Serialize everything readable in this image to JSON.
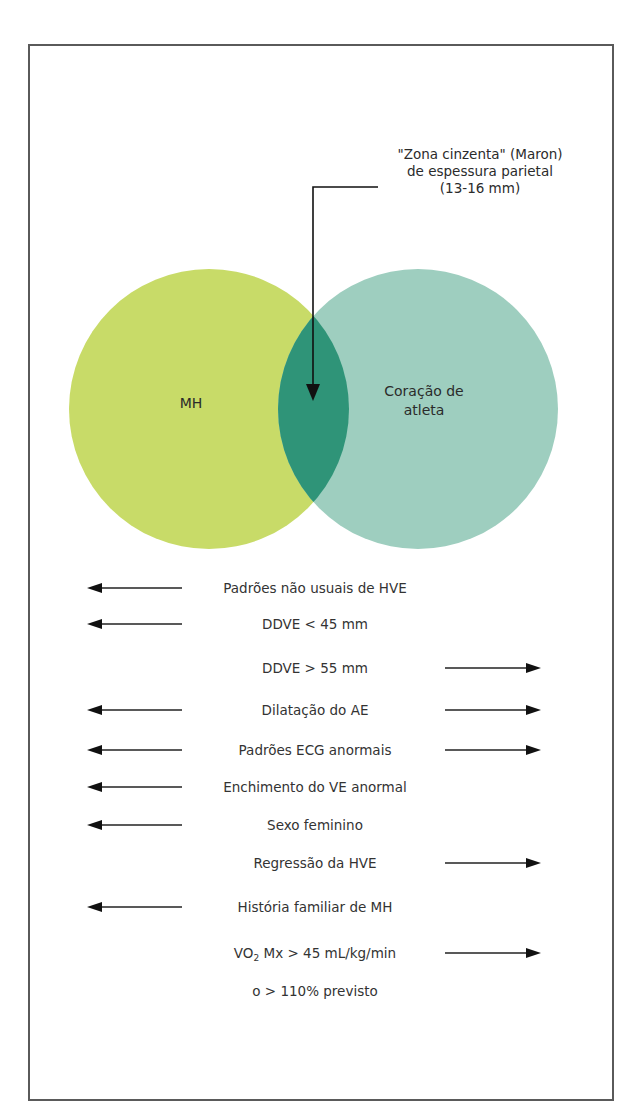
{
  "callout": {
    "lines": [
      "\"Zona cinzenta\" (Maron)",
      "de espessura parietal",
      "(13-16 mm)"
    ]
  },
  "venn": {
    "left_label": "MH",
    "right_label_lines": [
      "Coração de",
      "atleta"
    ],
    "colors": {
      "left": "#c8db68",
      "right": "#9ecebf",
      "overlap": "#2f9478"
    }
  },
  "criteria": [
    {
      "text": "Padrões não usuais de HVE",
      "left": true,
      "right": false
    },
    {
      "text": "DDVE < 45 mm",
      "left": true,
      "right": false
    },
    {
      "text": "DDVE > 55 mm",
      "left": false,
      "right": true
    },
    {
      "text": "Dilatação do AE",
      "left": true,
      "right": true
    },
    {
      "text": "Padrões ECG anormais",
      "left": true,
      "right": true
    },
    {
      "text": "Enchimento do VE anormal",
      "left": true,
      "right": false
    },
    {
      "text": "Sexo feminino",
      "left": true,
      "right": false
    },
    {
      "text": "Regressão da HVE",
      "left": false,
      "right": true
    },
    {
      "text": "História familiar de MH",
      "left": true,
      "right": false
    },
    {
      "text_prefix": "VO",
      "text_sub": "2",
      "text_suffix": " Mx > 45 mL/kg/min",
      "left": false,
      "right": true
    },
    {
      "text": "o > 110% previsto",
      "left": false,
      "right": false
    }
  ],
  "arrow_icons": {
    "left": "arrow-left-icon",
    "right": "arrow-right-icon",
    "callout": "arrow-down-icon"
  }
}
